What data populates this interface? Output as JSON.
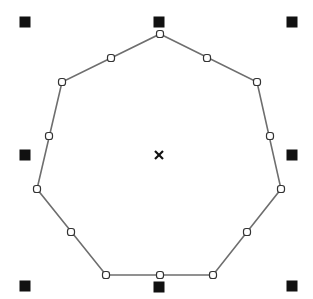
{
  "canvas": {
    "width": 313,
    "height": 299,
    "background": "#ffffff"
  },
  "shape": {
    "type": "heptagon",
    "stroke": "#6e6e6e",
    "stroke_width": 1.6,
    "vertices": [
      [
        160,
        34
      ],
      [
        257,
        82
      ],
      [
        281,
        189
      ],
      [
        213,
        275
      ],
      [
        106,
        275
      ],
      [
        37,
        189
      ],
      [
        62,
        82
      ]
    ],
    "midpoints": [
      [
        207,
        58
      ],
      [
        270,
        136
      ],
      [
        247,
        232
      ],
      [
        160,
        275
      ],
      [
        71,
        232
      ],
      [
        49,
        136
      ],
      [
        111,
        58
      ]
    ],
    "node_color": "#333333",
    "node_fill": "#ffffff",
    "node_size": 7
  },
  "selection": {
    "handle_color": "#111111",
    "handle_size": 11,
    "handles": [
      {
        "name": "handle-top-left",
        "x": 25,
        "y": 22
      },
      {
        "name": "handle-top-center",
        "x": 159,
        "y": 22
      },
      {
        "name": "handle-top-right",
        "x": 292,
        "y": 22
      },
      {
        "name": "handle-middle-left",
        "x": 25,
        "y": 155
      },
      {
        "name": "handle-middle-right",
        "x": 292,
        "y": 155
      },
      {
        "name": "handle-bottom-left",
        "x": 25,
        "y": 286
      },
      {
        "name": "handle-bottom-center",
        "x": 159,
        "y": 287
      },
      {
        "name": "handle-bottom-right",
        "x": 292,
        "y": 286
      }
    ],
    "center": {
      "x": 159,
      "y": 155,
      "glyph": "x-mark"
    }
  }
}
